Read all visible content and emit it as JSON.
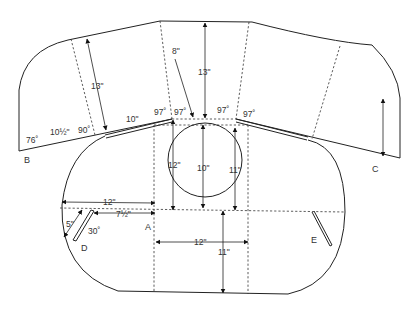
{
  "diagram": {
    "points": {
      "A": "A",
      "B": "B",
      "C": "C",
      "D": "D",
      "E": "E"
    },
    "angles": {
      "left_corner": "76˚",
      "left_fold": "90˚",
      "center_left_outer": "97˚",
      "center_left_inner": "97˚",
      "center_right_inner": "97˚",
      "center_right_outer": "97˚",
      "slot_d": "30˚"
    },
    "dimensions": {
      "left_flap_height": "13\"",
      "center_flap_height": "13\"",
      "center_offset": "8\"",
      "left_base_segment": "10\"",
      "left_base_fraction": "10½\"",
      "circle_left": "12\"",
      "circle_center": "10\"",
      "circle_right": "11\"",
      "left_width": "12\"",
      "slot_offset": "7½\"",
      "slot_depth": "5\"",
      "bottom_width": "12\"",
      "bottom_height": "11\""
    }
  }
}
